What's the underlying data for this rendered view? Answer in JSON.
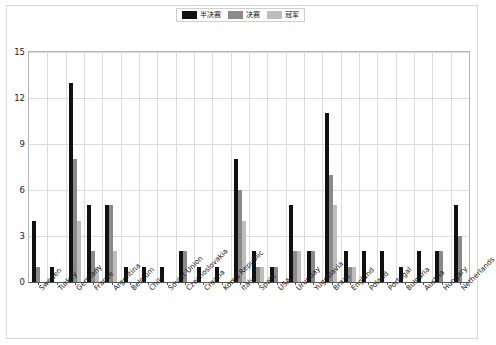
{
  "legend": {
    "position": "top-center",
    "items": [
      {
        "label": "半决赛",
        "color": "#111111",
        "name": "semi-final"
      },
      {
        "label": "决赛",
        "color": "#8a8a8a",
        "name": "final"
      },
      {
        "label": "冠军",
        "color": "#bdbdbd",
        "name": "champion"
      }
    ]
  },
  "chart_data": {
    "type": "bar",
    "title": "",
    "subtitle": "",
    "xlabel": "",
    "ylabel": "",
    "ylim": [
      0,
      15
    ],
    "yticks": [
      0,
      3,
      6,
      9,
      12,
      15
    ],
    "grid": true,
    "legend_position": "top-center",
    "categories": [
      "Sweden",
      "Turkey",
      "Germany",
      "France",
      "Argentina",
      "Belgium",
      "Chile",
      "Soviet Union",
      "Czechoslovakia",
      "Croatia",
      "Korea Republic",
      "Italy",
      "Spain",
      "USA",
      "Uruguay",
      "Yugoslavia",
      "Brazil",
      "England",
      "Poland",
      "Portugal",
      "Bulgaria",
      "Austria",
      "Hungary",
      "Netherlands"
    ],
    "series": [
      {
        "name": "半决赛",
        "color": "#111111",
        "values": [
          4,
          1,
          13,
          5,
          5,
          1,
          1,
          1,
          2,
          1,
          1,
          8,
          2,
          1,
          5,
          2,
          11,
          2,
          2,
          2,
          1,
          2,
          2,
          5
        ]
      },
      {
        "name": "决赛",
        "color": "#8a8a8a",
        "values": [
          1,
          0,
          8,
          2,
          5,
          0,
          0,
          0,
          2,
          0,
          0,
          6,
          1,
          1,
          2,
          2,
          7,
          1,
          0,
          0,
          0,
          0,
          2,
          3
        ]
      },
      {
        "name": "冠军",
        "color": "#bdbdbd",
        "values": [
          0,
          0,
          4,
          1,
          2,
          0,
          0,
          0,
          0,
          0,
          0,
          4,
          1,
          0,
          2,
          0,
          5,
          1,
          0,
          0,
          0,
          0,
          0,
          0
        ]
      }
    ]
  }
}
